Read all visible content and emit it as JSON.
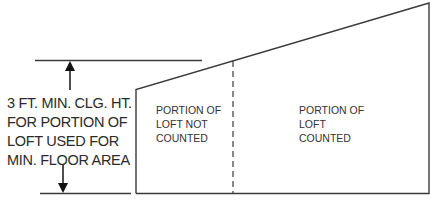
{
  "dimension_label": {
    "lines": [
      "3 FT. MIN. CLG. HT.",
      "FOR PORTION OF",
      "LOFT USED FOR",
      "MIN. FLOOR AREA"
    ]
  },
  "regions": {
    "not_counted": {
      "lines": [
        "PORTION OF",
        "LOFT NOT",
        "COUNTED"
      ]
    },
    "counted": {
      "lines": [
        "PORTION OF",
        "LOFT",
        "COUNTED"
      ]
    }
  },
  "colors": {
    "line": "#3a3a3a",
    "text": "#2a2a2a",
    "background": "#ffffff"
  }
}
